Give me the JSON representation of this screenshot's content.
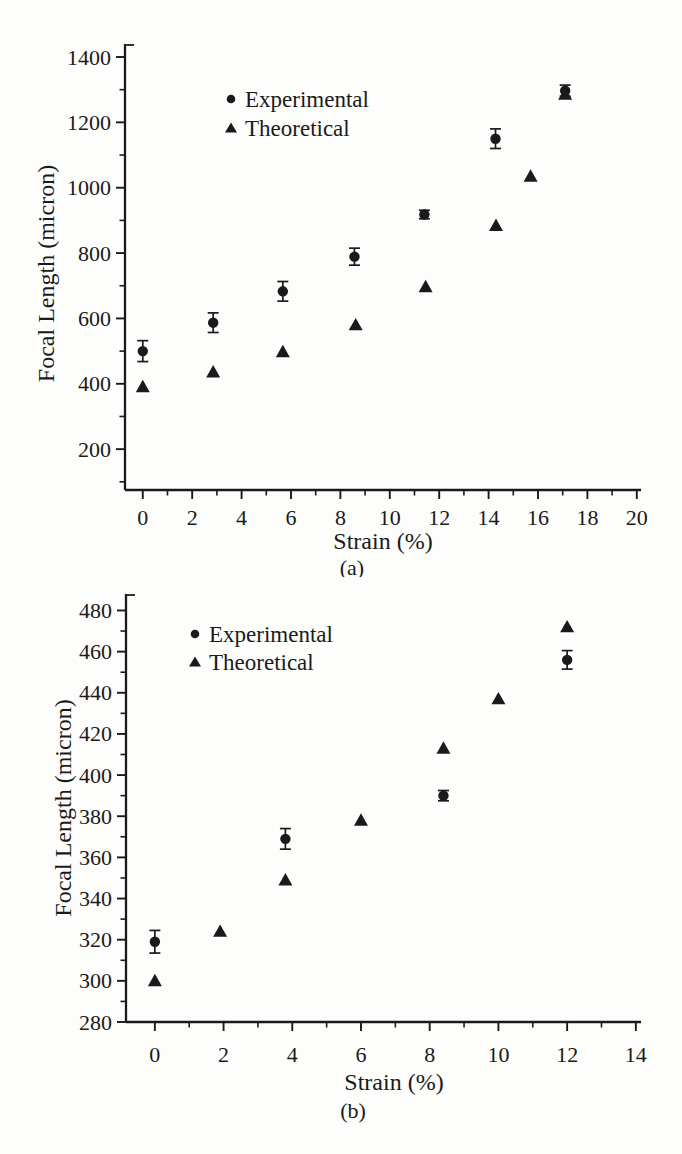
{
  "figure": {
    "background": "#fdfdfb",
    "ink": "#1a1a1a"
  },
  "chart_data": [
    {
      "id": "a",
      "type": "scatter",
      "caption": "(a)",
      "xlabel": "Strain (%)",
      "ylabel": "Focal Length (micron)",
      "xlim": [
        -0.72,
        20.17
      ],
      "ylim": [
        75,
        1400
      ],
      "grid": false,
      "legend_position": "upper-left-inside",
      "x_major_ticks": [
        0,
        2,
        4,
        6,
        8,
        10,
        12,
        14,
        16,
        18,
        20
      ],
      "x_minor_ticks": [
        1,
        3,
        5,
        7,
        9,
        11,
        13,
        15,
        17,
        19
      ],
      "y_major_ticks": [
        200,
        400,
        600,
        800,
        1000,
        1200,
        1400
      ],
      "y_minor_ticks": [
        100,
        300,
        500,
        700,
        900,
        1100,
        1300
      ],
      "series": [
        {
          "name": "Experimental",
          "marker": "circle",
          "x": [
            0,
            2.85,
            5.67,
            8.57,
            11.4,
            14.28,
            17.1
          ],
          "y": [
            500,
            587,
            683,
            789,
            918,
            1150,
            1297
          ],
          "yerr": [
            32,
            30,
            30,
            26,
            13,
            30,
            17
          ]
        },
        {
          "name": "Theoretical",
          "marker": "triangle",
          "x": [
            0,
            2.85,
            5.67,
            8.62,
            11.45,
            14.3,
            15.7,
            17.1
          ],
          "y": [
            391,
            436,
            498,
            580,
            697,
            884,
            1035,
            1286
          ]
        }
      ]
    },
    {
      "id": "b",
      "type": "scatter",
      "caption": "(b)",
      "xlabel": "Strain (%)",
      "ylabel": "Focal Length (micron)",
      "xlim": [
        -0.84,
        14.15
      ],
      "ylim": [
        280,
        488
      ],
      "grid": false,
      "legend_position": "upper-left-inside",
      "x_major_ticks": [
        0,
        2,
        4,
        6,
        8,
        10,
        12,
        14
      ],
      "x_minor_ticks": [
        1,
        3,
        5,
        7,
        9,
        11,
        13
      ],
      "y_major_ticks": [
        280,
        300,
        320,
        340,
        360,
        380,
        400,
        420,
        440,
        460,
        480
      ],
      "y_minor_ticks": [
        290,
        310,
        330,
        350,
        370,
        390,
        410,
        430,
        450,
        470
      ],
      "series": [
        {
          "name": "Experimental",
          "marker": "circle",
          "x": [
            0,
            3.8,
            8.4,
            12
          ],
          "y": [
            319,
            369,
            390,
            456
          ],
          "yerr": [
            5.5,
            5,
            2.5,
            4.5
          ]
        },
        {
          "name": "Theoretical",
          "marker": "triangle",
          "x": [
            0,
            1.9,
            3.8,
            6,
            8.4,
            10,
            12
          ],
          "y": [
            300,
            324,
            349,
            378,
            413,
            437,
            472
          ]
        }
      ]
    }
  ]
}
